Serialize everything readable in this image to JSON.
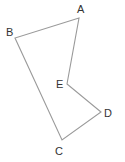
{
  "diagram": {
    "type": "polygon",
    "stroke_color": "#9a9a9a",
    "label_color": "#333333",
    "vertices": [
      {
        "name": "A",
        "x": 79,
        "y": 18,
        "label_x": 77,
        "label_y": 13
      },
      {
        "name": "B",
        "x": 15,
        "y": 38,
        "label_x": 6,
        "label_y": 36
      },
      {
        "name": "C",
        "x": 62,
        "y": 140,
        "label_x": 55,
        "label_y": 155
      },
      {
        "name": "D",
        "x": 101,
        "y": 112,
        "label_x": 104,
        "label_y": 117
      },
      {
        "name": "E",
        "x": 67,
        "y": 84,
        "label_x": 56,
        "label_y": 88
      }
    ],
    "edges": [
      [
        "A",
        "B"
      ],
      [
        "B",
        "C"
      ],
      [
        "C",
        "D"
      ],
      [
        "D",
        "E"
      ],
      [
        "E",
        "A"
      ]
    ]
  }
}
